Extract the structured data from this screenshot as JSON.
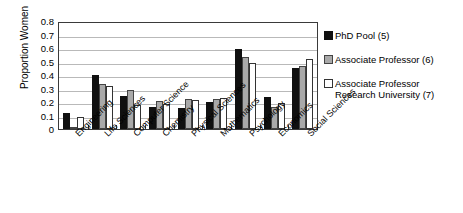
{
  "chart_data": {
    "type": "bar",
    "title": "",
    "xlabel": "",
    "ylabel": "Proportion Women",
    "ylim": [
      0,
      0.8
    ],
    "ytick_labels": [
      "0.8",
      "0.7",
      "0.6",
      "0.5",
      "0.4",
      "0.3",
      "0.2",
      "0.1",
      "0"
    ],
    "ytick_values": [
      0.8,
      0.7,
      0.6,
      0.5,
      0.4,
      0.3,
      0.2,
      0.1,
      0
    ],
    "grid": true,
    "legend_position": "right",
    "categories": [
      "Engineering",
      "Life Sciences",
      "Computer Science",
      "Chemistry",
      "Physical Sciences",
      "Mathematics",
      "Psychology",
      "Economics",
      "Social Sciences"
    ],
    "series": [
      {
        "name": "PhD Pool (5)",
        "color": "#101010",
        "values": [
          0.12,
          0.4,
          0.245,
          0.16,
          0.155,
          0.2,
          0.59,
          0.24,
          0.455
        ]
      },
      {
        "name": "Associate Professor (6)",
        "color": "#a9a9a9",
        "values": [
          0.01,
          0.33,
          0.29,
          0.21,
          0.22,
          0.225,
          0.535,
          0.16,
          0.47
        ]
      },
      {
        "name": "Associate Professor\nResearch University (7)",
        "color": "#ffffff",
        "values": [
          0.09,
          0.32,
          0.18,
          0.185,
          0.215,
          0.23,
          0.49,
          0.19,
          0.515
        ]
      }
    ]
  },
  "legend": {
    "items": [
      {
        "label": "PhD Pool (5)"
      },
      {
        "label": "Associate Professor (6)"
      },
      {
        "label": "Associate Professor\nResearch University (7)"
      }
    ]
  }
}
